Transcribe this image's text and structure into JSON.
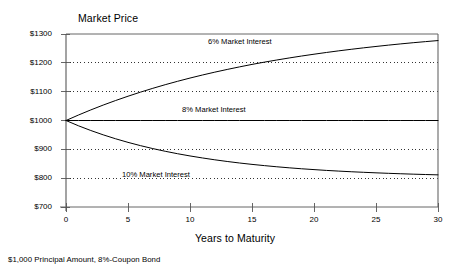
{
  "chart_data": {
    "type": "line",
    "title": "",
    "ylabel": "Market Price",
    "xlabel": "Years to Maturity",
    "caption": "$1,000 Principal Amount, 8%-Coupon Bond",
    "xlim": [
      0,
      30
    ],
    "ylim": [
      700,
      1300
    ],
    "x_ticks": [
      0,
      5,
      10,
      15,
      20,
      25,
      30
    ],
    "x_tick_labels": [
      "0",
      "5",
      "10",
      "15",
      "20",
      "25",
      "30"
    ],
    "y_ticks": [
      700,
      800,
      900,
      1000,
      1100,
      1200,
      1300
    ],
    "y_tick_labels": [
      "$700",
      "$800",
      "$900",
      "$1000",
      "$1100",
      "$1200",
      "$1300"
    ],
    "grid": "horizontal-dotted",
    "gridlines_at": [
      800,
      900,
      1100,
      1200
    ],
    "legend_position": "inline-annotations",
    "x": [
      0,
      1,
      2,
      3,
      4,
      5,
      6,
      7,
      8,
      9,
      10,
      11,
      12,
      13,
      14,
      15,
      16,
      17,
      18,
      19,
      20,
      21,
      22,
      23,
      24,
      25,
      26,
      27,
      28,
      29,
      30
    ],
    "series": [
      {
        "name": "6% Market Interest",
        "label": "6% Market Interest",
        "color": "#000000",
        "values": [
          1000,
          1018.9,
          1036.7,
          1053.5,
          1069.3,
          1084.2,
          1098.3,
          1111.6,
          1124.2,
          1136.0,
          1147.2,
          1157.7,
          1167.7,
          1177.1,
          1186.0,
          1194.5,
          1202.4,
          1209.8,
          1216.9,
          1223.6,
          1229.9,
          1235.9,
          1241.6,
          1246.9,
          1252.0,
          1256.8,
          1261.4,
          1265.7,
          1269.8,
          1273.6,
          1277.3
        ]
      },
      {
        "name": "8% Market Interest",
        "label": "8% Market Interest",
        "color": "#000000",
        "values": [
          1000,
          1000,
          1000,
          1000,
          1000,
          1000,
          1000,
          1000,
          1000,
          1000,
          1000,
          1000,
          1000,
          1000,
          1000,
          1000,
          1000,
          1000,
          1000,
          1000,
          1000,
          1000,
          1000,
          1000,
          1000,
          1000,
          1000,
          1000,
          1000,
          1000,
          1000
        ]
      },
      {
        "name": "10% Market Interest",
        "label": "10% Market Interest",
        "color": "#000000",
        "values": [
          1000,
          981.8,
          965.3,
          950.3,
          936.6,
          924.2,
          912.9,
          902.6,
          893.3,
          884.8,
          877.1,
          870.1,
          863.7,
          857.9,
          852.6,
          847.8,
          843.5,
          839.5,
          835.9,
          832.6,
          829.7,
          826.9,
          824.5,
          822.3,
          820.3,
          818.5,
          816.8,
          815.3,
          813.9,
          812.6,
          811.5
        ]
      }
    ]
  },
  "annotations": {
    "six_percent": "6% Market Interest",
    "eight_percent": "8% Market Interest",
    "ten_percent": "10% Market Interest"
  }
}
